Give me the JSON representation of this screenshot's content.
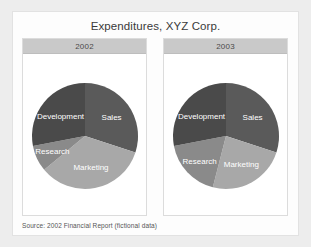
{
  "title": "Expenditures, XYZ Corp.",
  "source_note": "Source:  2002 Financial Report (fictional data)",
  "colors": {
    "page_background": "#ededed",
    "card_background": "#fdfdfd",
    "panel_background": "#ffffff",
    "panel_header": "#c9c9c9",
    "sales": "#5a5a5a",
    "marketing": "#a8a8a8",
    "research": "#8a8a8a",
    "development": "#4a4a4a",
    "label_text": "#ffffff",
    "title_text": "#3a3a3a"
  },
  "panels": [
    {
      "year": "2002"
    },
    {
      "year": "2003"
    }
  ],
  "chart_data": [
    {
      "type": "pie",
      "title": "2002",
      "categories": [
        "Sales",
        "Marketing",
        "Research",
        "Development"
      ],
      "values": [
        30,
        34,
        8,
        28
      ],
      "unit": "percent",
      "start_angle_deg": 0,
      "direction": "clockwise",
      "colors": [
        "#5a5a5a",
        "#a8a8a8",
        "#8a8a8a",
        "#4a4a4a"
      ],
      "labels_inside": true,
      "legend": "none"
    },
    {
      "type": "pie",
      "title": "2003",
      "categories": [
        "Sales",
        "Marketing",
        "Research",
        "Development"
      ],
      "values": [
        30,
        24,
        18,
        28
      ],
      "unit": "percent",
      "start_angle_deg": 0,
      "direction": "clockwise",
      "colors": [
        "#5a5a5a",
        "#a8a8a8",
        "#8a8a8a",
        "#4a4a4a"
      ],
      "labels_inside": true,
      "legend": "none"
    }
  ]
}
